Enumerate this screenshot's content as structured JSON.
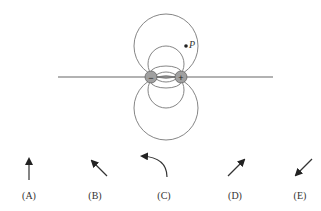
{
  "figure": {
    "point_label": "P",
    "charges": [
      {
        "sign": "−",
        "x": 151,
        "y": 77,
        "fill": "#9a9a9a"
      },
      {
        "sign": "+",
        "x": 181,
        "y": 77,
        "fill": "#9a9a9a"
      }
    ],
    "line_color": "#888888"
  },
  "options": [
    {
      "label": "(A)",
      "x": 29,
      "direction": "up"
    },
    {
      "label": "(B)",
      "x": 95,
      "direction": "up-left"
    },
    {
      "label": "(C)",
      "x": 164,
      "direction": "curved-left"
    },
    {
      "label": "(D)",
      "x": 235,
      "direction": "up-right"
    },
    {
      "label": "(E)",
      "x": 300,
      "direction": "down-left"
    }
  ]
}
